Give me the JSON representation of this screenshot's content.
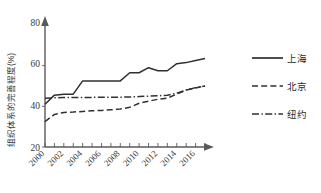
{
  "chart_data": {
    "type": "line",
    "title": "",
    "xlabel": "",
    "ylabel": "组织体系的完善程度(%)",
    "xlim": [
      2000,
      2017
    ],
    "ylim": [
      20,
      80
    ],
    "y_ticks": [
      20,
      40,
      60,
      80
    ],
    "x_ticks": [
      2000,
      2001,
      2002,
      2003,
      2004,
      2005,
      2006,
      2007,
      2008,
      2009,
      2010,
      2011,
      2012,
      2013,
      2014,
      2015,
      2016,
      2017
    ],
    "x_tick_labels": [
      "2000",
      "2002",
      "2004",
      "2006",
      "2008",
      "2010",
      "2012",
      "2014",
      "2016"
    ],
    "x_tick_label_years": [
      2000,
      2002,
      2004,
      2006,
      2008,
      2010,
      2012,
      2014,
      2016
    ],
    "grid": false,
    "legend_position": "right",
    "x": [
      2000,
      2001,
      2002,
      2003,
      2004,
      2005,
      2006,
      2007,
      2008,
      2009,
      2010,
      2011,
      2012,
      2013,
      2014,
      2015,
      2016,
      2017
    ],
    "series": [
      {
        "name": "上海",
        "style": "solid",
        "values": [
          41.0,
          45.5,
          46.0,
          46.0,
          52.5,
          52.5,
          52.5,
          52.5,
          52.5,
          56.5,
          56.5,
          59.0,
          57.5,
          57.5,
          61.0,
          61.5,
          62.5,
          63.5
        ]
      },
      {
        "name": "北京",
        "style": "dashed",
        "values": [
          32.5,
          36.0,
          37.0,
          37.2,
          37.5,
          37.8,
          38.0,
          38.3,
          38.7,
          39.5,
          41.5,
          42.5,
          43.5,
          44.0,
          46.0,
          48.0,
          49.0,
          50.0
        ]
      },
      {
        "name": "纽约",
        "style": "dashdot",
        "values": [
          44.0,
          44.2,
          44.3,
          44.3,
          44.4,
          44.4,
          44.5,
          44.5,
          44.5,
          44.6,
          44.8,
          45.0,
          45.2,
          45.5,
          46.5,
          48.0,
          49.2,
          50.0
        ]
      }
    ]
  },
  "axis": {
    "y_label": "组织体系的完善程度(%)",
    "y_tick_80": "80",
    "y_tick_60": "60",
    "y_tick_40": "40",
    "y_tick_20": "20"
  },
  "legend": {
    "items": [
      {
        "label": "上海",
        "style": "solid"
      },
      {
        "label": "北京",
        "style": "dashed"
      },
      {
        "label": "纽约",
        "style": "dashdot"
      }
    ]
  }
}
